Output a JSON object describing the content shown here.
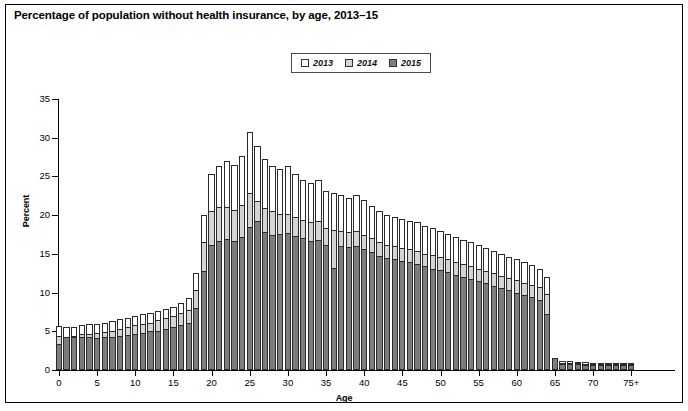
{
  "title": "Percentage of population without health insurance, by age, 2013–15",
  "legend": {
    "items": [
      {
        "label": "2013",
        "color": "#ffffff",
        "name": "legend-swatch-2013"
      },
      {
        "label": "2014",
        "color": "#d4d4d4",
        "name": "legend-swatch-2014"
      },
      {
        "label": "2015",
        "color": "#7d7d7d",
        "name": "legend-swatch-2015"
      }
    ]
  },
  "axes": {
    "ylabel": "Percent",
    "xlabel": "Age",
    "yticks": [
      "0",
      "5",
      "10",
      "15",
      "20",
      "25",
      "30",
      "35"
    ],
    "xticks": [
      "0",
      "5",
      "10",
      "15",
      "20",
      "25",
      "30",
      "35",
      "40",
      "45",
      "50",
      "55",
      "60",
      "65",
      "70",
      "75+"
    ]
  },
  "chart_data": {
    "type": "bar",
    "subtype": "overlaid-grouped-vertical",
    "title": "Percentage of population without health insurance, by age, 2013–15",
    "xlabel": "Age",
    "ylabel": "Percent",
    "xlim": [
      -0.5,
      75.5
    ],
    "ylim": [
      0,
      35
    ],
    "ytick_step": 5,
    "xtick_step": 5,
    "grid": false,
    "legend_position": "top-center",
    "categories": [
      0,
      1,
      2,
      3,
      4,
      5,
      6,
      7,
      8,
      9,
      10,
      11,
      12,
      13,
      14,
      15,
      16,
      17,
      18,
      19,
      20,
      21,
      22,
      23,
      24,
      25,
      26,
      27,
      28,
      29,
      30,
      31,
      32,
      33,
      34,
      35,
      36,
      37,
      38,
      39,
      40,
      41,
      42,
      43,
      44,
      45,
      46,
      47,
      48,
      49,
      50,
      51,
      52,
      53,
      54,
      55,
      56,
      57,
      58,
      59,
      60,
      61,
      62,
      63,
      64,
      65,
      66,
      67,
      68,
      69,
      70,
      71,
      72,
      73,
      74,
      75
    ],
    "category_labels_note": "Ages 0 through 74 individually; final category is 75+",
    "series": [
      {
        "name": "2013",
        "color": "#ffffff",
        "values": [
          5.7,
          5.5,
          5.6,
          5.8,
          5.9,
          6.0,
          6.1,
          6.3,
          6.6,
          6.7,
          7.0,
          7.2,
          7.3,
          7.6,
          7.9,
          8.2,
          8.7,
          9.3,
          12.5,
          20.0,
          25.3,
          26.4,
          27.0,
          26.5,
          27.6,
          30.8,
          28.9,
          27.3,
          26.4,
          26.0,
          26.3,
          25.3,
          24.6,
          24.2,
          24.6,
          23.1,
          22.8,
          22.6,
          22.2,
          22.6,
          21.9,
          21.2,
          20.5,
          20.0,
          19.8,
          19.5,
          19.3,
          19.1,
          18.6,
          18.3,
          18.0,
          17.6,
          17.2,
          16.8,
          16.5,
          16.2,
          15.8,
          15.4,
          15.0,
          14.6,
          14.3,
          13.9,
          13.5,
          13.1,
          12.0,
          1.2,
          1.1,
          1.1,
          1.0,
          1.0,
          0.9,
          0.9,
          0.9,
          0.9,
          0.9,
          0.9
        ]
      },
      {
        "name": "2014",
        "color": "#d4d4d4",
        "values": [
          4.4,
          4.3,
          4.4,
          4.6,
          4.7,
          4.8,
          4.9,
          5.1,
          5.3,
          5.5,
          5.8,
          6.0,
          6.1,
          6.4,
          6.7,
          7.0,
          7.4,
          7.8,
          10.3,
          16.5,
          20.5,
          21.0,
          21.1,
          20.7,
          21.3,
          22.8,
          21.8,
          20.9,
          20.6,
          20.2,
          20.1,
          19.7,
          19.4,
          19.1,
          19.3,
          18.4,
          18.1,
          18.0,
          17.8,
          17.9,
          17.5,
          17.0,
          16.5,
          16.2,
          16.0,
          15.8,
          15.6,
          15.4,
          15.0,
          14.8,
          14.6,
          14.3,
          14.0,
          13.7,
          13.4,
          13.1,
          12.8,
          12.5,
          12.2,
          11.9,
          11.6,
          11.3,
          11.0,
          10.7,
          9.8,
          1.0,
          0.9,
          0.9,
          0.9,
          0.8,
          0.8,
          0.8,
          0.8,
          0.8,
          0.8,
          0.8
        ]
      },
      {
        "name": "2015",
        "color": "#7d7d7d",
        "values": [
          3.4,
          4.2,
          4.2,
          4.3,
          4.3,
          4.1,
          4.2,
          4.3,
          4.4,
          4.5,
          4.7,
          4.8,
          5.0,
          5.1,
          5.3,
          5.5,
          5.8,
          6.1,
          8.0,
          12.8,
          16.2,
          16.7,
          16.9,
          16.6,
          17.2,
          18.5,
          19.2,
          17.8,
          17.5,
          17.6,
          17.7,
          17.3,
          17.0,
          16.6,
          16.8,
          16.2,
          13.2,
          16.0,
          15.9,
          16.0,
          15.6,
          15.2,
          14.7,
          14.5,
          14.3,
          14.1,
          13.9,
          13.7,
          13.4,
          13.1,
          12.9,
          12.6,
          12.3,
          12.0,
          11.8,
          11.5,
          11.2,
          10.9,
          10.6,
          10.3,
          10.0,
          9.7,
          9.4,
          9.1,
          7.2,
          1.5,
          0.8,
          0.8,
          0.8,
          0.7,
          0.7,
          0.7,
          0.7,
          0.7,
          0.7,
          0.7
        ]
      }
    ],
    "annotations": [
      "Sharp drop at age 65 reflects Medicare eligibility",
      "Peak uninsured rate occurs in mid-20s"
    ]
  }
}
